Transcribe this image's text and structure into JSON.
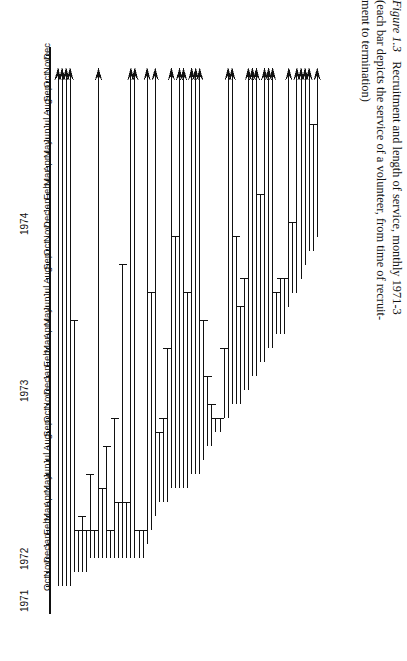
{
  "figure": {
    "number_label": "Figure 1.3",
    "title_text": "Recruitment and length of service, monthly 1971-3",
    "subtitle_line1": "(each bar depicts the service of a volunteer, from time of recruit-",
    "subtitle_line2": "ment to termination)"
  },
  "axis": {
    "orientation": "vertical",
    "year_labels": [
      "1971",
      "1972",
      "1973",
      "1974"
    ],
    "tick_labels": [
      "Oct",
      "Nov",
      "Dec",
      "Jan",
      "Feb",
      "Mar",
      "Apr",
      "May",
      "Jun",
      "Jul",
      "Aug",
      "Sep",
      "Oct",
      "Nov",
      "Dec",
      "Jan",
      "Feb",
      "Mar",
      "Apr",
      "May",
      "Jun",
      "Jul",
      "Aug",
      "Sep",
      "Oct",
      "Nov",
      "Dec",
      "Jan",
      "Feb",
      "Mar",
      "Apr",
      "May",
      "Jun",
      "Jul",
      "Aug",
      "Sep",
      "Oct",
      "Nov",
      "Dec"
    ],
    "line_color": "#111111"
  },
  "chart_data": {
    "type": "bar",
    "title": "Recruitment and length of service, monthly 1971-3",
    "xlabel": "volunteer (ordered by recruitment date)",
    "ylabel": "time",
    "ylim": [
      0,
      40
    ],
    "grid": false,
    "legend": null,
    "units": "months since Sep 1971 (0 = Sep 1971, 1 = Oct 1971 ...)",
    "censored_marker": "arrowhead (still serving at end of observation)",
    "terminated_marker": "flat cap (service ended)",
    "categories": [
      "v1",
      "v2",
      "v3",
      "v4",
      "v5",
      "v6",
      "v7",
      "v8",
      "v9",
      "v10",
      "v11",
      "v12",
      "v13",
      "v14",
      "v15",
      "v16",
      "v17",
      "v18",
      "v19",
      "v20",
      "v21",
      "v22",
      "v23",
      "v24",
      "v25",
      "v26",
      "v27",
      "v28",
      "v29",
      "v30",
      "v31",
      "v32",
      "v33",
      "v34",
      "v35",
      "v36",
      "v37",
      "v38",
      "v39",
      "v40",
      "v41",
      "v42",
      "v43",
      "v44",
      "v45",
      "v46",
      "v47",
      "v48",
      "v49",
      "v50",
      "v51",
      "v52",
      "v53",
      "v54",
      "v55",
      "v56",
      "v57",
      "v58",
      "v59",
      "v60",
      "v61",
      "v62",
      "v63",
      "v64",
      "v65"
    ],
    "bars": [
      {
        "id": "v1",
        "start": 1,
        "end": 38,
        "censored": true
      },
      {
        "id": "v2",
        "start": 1,
        "end": 38,
        "censored": true
      },
      {
        "id": "v3",
        "start": 1,
        "end": 38,
        "censored": true
      },
      {
        "id": "v4",
        "start": 1,
        "end": 38,
        "censored": true
      },
      {
        "id": "v5",
        "start": 2,
        "end": 20,
        "censored": false
      },
      {
        "id": "v6",
        "start": 2,
        "end": 5,
        "censored": false
      },
      {
        "id": "v7",
        "start": 2,
        "end": 6,
        "censored": false
      },
      {
        "id": "v8",
        "start": 2,
        "end": 5,
        "censored": false
      },
      {
        "id": "v9",
        "start": 3,
        "end": 9,
        "censored": false
      },
      {
        "id": "v10",
        "start": 3,
        "end": 5,
        "censored": false
      },
      {
        "id": "v11",
        "start": 3,
        "end": 38,
        "censored": true
      },
      {
        "id": "v12",
        "start": 3,
        "end": 8,
        "censored": false
      },
      {
        "id": "v13",
        "start": 3,
        "end": 11,
        "censored": false
      },
      {
        "id": "v14",
        "start": 3,
        "end": 5,
        "censored": false
      },
      {
        "id": "v15",
        "start": 3,
        "end": 13,
        "censored": false
      },
      {
        "id": "v16",
        "start": 3,
        "end": 7,
        "censored": false
      },
      {
        "id": "v17",
        "start": 3,
        "end": 24,
        "censored": false
      },
      {
        "id": "v18",
        "start": 3,
        "end": 7,
        "censored": false
      },
      {
        "id": "v19",
        "start": 3,
        "end": 38,
        "censored": true
      },
      {
        "id": "v20",
        "start": 3,
        "end": 38,
        "censored": true
      },
      {
        "id": "v21",
        "start": 3,
        "end": 5,
        "censored": false
      },
      {
        "id": "v22",
        "start": 3,
        "end": 5,
        "censored": false
      },
      {
        "id": "v23",
        "start": 4,
        "end": 38,
        "censored": true
      },
      {
        "id": "v24",
        "start": 5,
        "end": 22,
        "censored": false
      },
      {
        "id": "v25",
        "start": 6,
        "end": 38,
        "censored": true
      },
      {
        "id": "v26",
        "start": 7,
        "end": 12,
        "censored": false
      },
      {
        "id": "v27",
        "start": 7,
        "end": 13,
        "censored": false
      },
      {
        "id": "v28",
        "start": 7,
        "end": 18,
        "censored": false
      },
      {
        "id": "v29",
        "start": 8,
        "end": 38,
        "censored": true
      },
      {
        "id": "v30",
        "start": 8,
        "end": 26,
        "censored": false
      },
      {
        "id": "v31",
        "start": 8,
        "end": 38,
        "censored": true
      },
      {
        "id": "v32",
        "start": 8,
        "end": 38,
        "censored": true
      },
      {
        "id": "v33",
        "start": 8,
        "end": 22,
        "censored": false
      },
      {
        "id": "v34",
        "start": 9,
        "end": 38,
        "censored": true
      },
      {
        "id": "v35",
        "start": 9,
        "end": 38,
        "censored": true
      },
      {
        "id": "v36",
        "start": 9,
        "end": 38,
        "censored": true
      },
      {
        "id": "v37",
        "start": 10,
        "end": 20,
        "censored": false
      },
      {
        "id": "v38",
        "start": 11,
        "end": 16,
        "censored": false
      },
      {
        "id": "v39",
        "start": 11,
        "end": 14,
        "censored": false
      },
      {
        "id": "v40",
        "start": 12,
        "end": 13,
        "censored": false
      },
      {
        "id": "v41",
        "start": 12,
        "end": 13,
        "censored": false
      },
      {
        "id": "v42",
        "start": 13,
        "end": 18,
        "censored": false
      },
      {
        "id": "v43",
        "start": 13,
        "end": 38,
        "censored": true
      },
      {
        "id": "v44",
        "start": 14,
        "end": 38,
        "censored": true
      },
      {
        "id": "v45",
        "start": 14,
        "end": 26,
        "censored": false
      },
      {
        "id": "v46",
        "start": 14,
        "end": 21,
        "censored": false
      },
      {
        "id": "v47",
        "start": 15,
        "end": 23,
        "censored": false
      },
      {
        "id": "v48",
        "start": 15,
        "end": 38,
        "censored": true
      },
      {
        "id": "v49",
        "start": 16,
        "end": 38,
        "censored": true
      },
      {
        "id": "v50",
        "start": 16,
        "end": 38,
        "censored": true
      },
      {
        "id": "v51",
        "start": 17,
        "end": 29,
        "censored": false
      },
      {
        "id": "v52",
        "start": 17,
        "end": 38,
        "censored": true
      },
      {
        "id": "v53",
        "start": 18,
        "end": 38,
        "censored": true
      },
      {
        "id": "v54",
        "start": 18,
        "end": 38,
        "censored": true
      },
      {
        "id": "v55",
        "start": 19,
        "end": 22,
        "censored": false
      },
      {
        "id": "v56",
        "start": 19,
        "end": 23,
        "censored": false
      },
      {
        "id": "v57",
        "start": 19,
        "end": 23,
        "censored": false
      },
      {
        "id": "v58",
        "start": 21,
        "end": 38,
        "censored": true
      },
      {
        "id": "v59",
        "start": 22,
        "end": 27,
        "censored": false
      },
      {
        "id": "v60",
        "start": 22,
        "end": 38,
        "censored": true
      },
      {
        "id": "v61",
        "start": 23,
        "end": 38,
        "censored": true
      },
      {
        "id": "v62",
        "start": 24,
        "end": 38,
        "censored": true
      },
      {
        "id": "v63",
        "start": 25,
        "end": 38,
        "censored": true
      },
      {
        "id": "v64",
        "start": 25,
        "end": 34,
        "censored": false
      },
      {
        "id": "v65",
        "start": 26,
        "end": 38,
        "censored": true
      }
    ]
  }
}
